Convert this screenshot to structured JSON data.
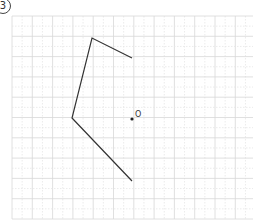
{
  "problem": {
    "number_label": "3"
  },
  "grid": {
    "origin_x": 12,
    "origin_y": 16,
    "cell": 20.3,
    "cols": 12,
    "rows": 10,
    "solid_color": "#d8d8d8",
    "dotted_color": "#e6e6e6"
  },
  "figure": {
    "stroke_color": "#333333",
    "polyline_points_px": [
      [
        132,
        58
      ],
      [
        92,
        38
      ],
      [
        72,
        118
      ],
      [
        132,
        181
      ]
    ],
    "polyline_points_grid": [
      [
        6,
        2
      ],
      [
        4,
        1
      ],
      [
        3,
        5
      ],
      [
        6,
        8
      ]
    ]
  },
  "point_o": {
    "label": "O",
    "x": 132,
    "y": 119,
    "label_x": 135,
    "label_y": 117
  }
}
